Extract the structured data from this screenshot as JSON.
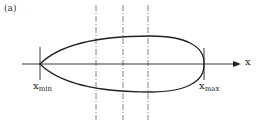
{
  "figure": {
    "panel_label": "(a)",
    "axis_label": "x",
    "xmin_label": {
      "base": "x",
      "sub": "min"
    },
    "xmax_label": {
      "base": "x",
      "sub": "max"
    },
    "colors": {
      "stroke": "#222222",
      "dashed": "#555555",
      "background": "#ffffff"
    }
  }
}
